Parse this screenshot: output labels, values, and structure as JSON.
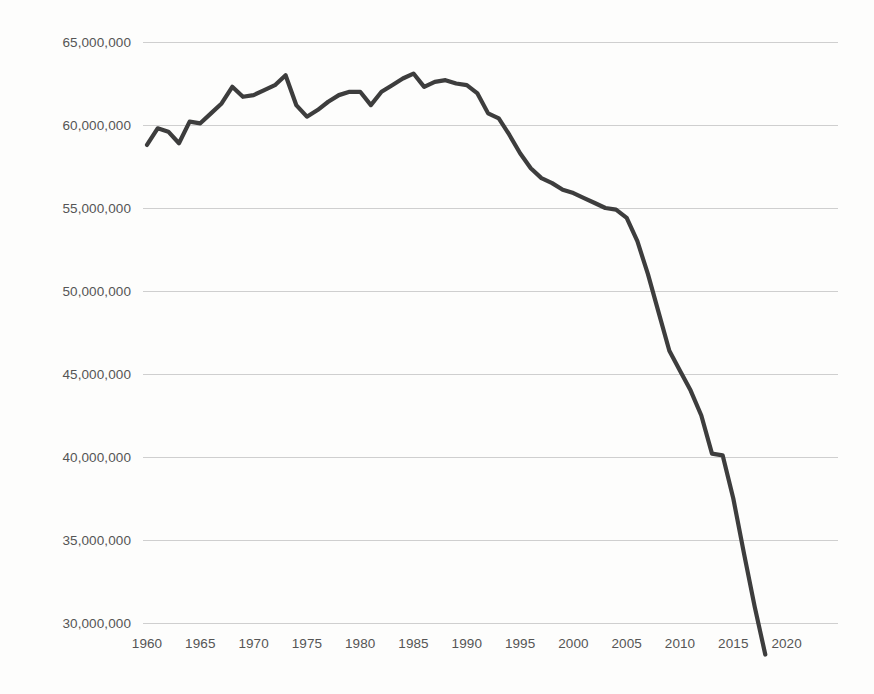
{
  "chart_data": {
    "type": "line",
    "title": "",
    "subtitle": "",
    "xlabel": "",
    "ylabel": "",
    "legend": [],
    "legend_position": "none",
    "grid": true,
    "grid_axis": "y",
    "xlim": [
      1958.5,
      2021.5
    ],
    "ylim": [
      28000000,
      66500000
    ],
    "line_color": "#3d3d3d",
    "grid_color": "#cfcfcf",
    "background_color": "#fdfdfc",
    "tick_label_color": "#555555",
    "y_ticks": [
      65000000,
      60000000,
      55000000,
      50000000,
      45000000,
      40000000,
      35000000,
      30000000
    ],
    "y_tick_labels": [
      "65,000,000",
      "60,000,000",
      "55,000,000",
      "50,000,000",
      "45,000,000",
      "40,000,000",
      "35,000,000",
      "30,000,000"
    ],
    "x_ticks": [
      1960,
      1965,
      1970,
      1975,
      1980,
      1985,
      1990,
      1995,
      2000,
      2005,
      2010,
      2015,
      2020
    ],
    "x_tick_labels": [
      "1960",
      "1965",
      "1970",
      "1975",
      "1980",
      "1985",
      "1990",
      "1995",
      "2000",
      "2005",
      "2010",
      "2015",
      "2020"
    ],
    "series": [
      {
        "name": "value",
        "x": [
          1960,
          1961,
          1962,
          1963,
          1964,
          1965,
          1966,
          1967,
          1968,
          1969,
          1970,
          1971,
          1972,
          1973,
          1974,
          1975,
          1976,
          1977,
          1978,
          1979,
          1980,
          1981,
          1982,
          1983,
          1984,
          1985,
          1986,
          1987,
          1988,
          1989,
          1990,
          1991,
          1992,
          1993,
          1994,
          1995,
          1996,
          1997,
          1998,
          1999,
          2000,
          2001,
          2002,
          2003,
          2004,
          2005,
          2006,
          2007,
          2008,
          2009,
          2010,
          2011,
          2012,
          2013,
          2014,
          2015,
          2016,
          2017,
          2018
        ],
        "values": [
          58800000,
          59800000,
          59600000,
          58900000,
          60200000,
          60100000,
          60700000,
          61300000,
          62300000,
          61700000,
          61800000,
          62100000,
          62400000,
          63000000,
          61200000,
          60500000,
          60900000,
          61400000,
          61800000,
          62000000,
          62000000,
          61200000,
          62000000,
          62400000,
          62800000,
          63100000,
          62300000,
          62600000,
          62700000,
          62500000,
          62400000,
          61900000,
          60700000,
          60400000,
          59400000,
          58300000,
          57400000,
          56800000,
          56500000,
          56100000,
          55900000,
          55600000,
          55300000,
          55000000,
          54900000,
          54400000,
          53000000,
          51000000,
          48700000,
          46400000,
          45200000,
          44000000,
          42500000,
          40200000,
          40100000,
          37500000,
          34200000,
          31000000,
          28100000
        ]
      }
    ]
  },
  "axis": {
    "y_label_sample": "65,000,000",
    "x_label_first": "1960",
    "x_label_last": "2020"
  }
}
